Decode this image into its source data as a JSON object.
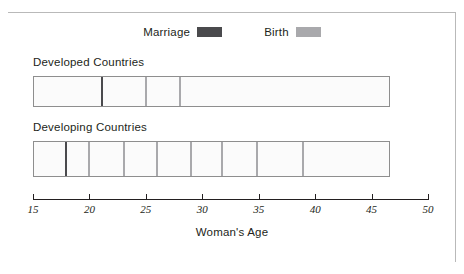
{
  "legend": {
    "items": [
      {
        "label": "Marriage",
        "color": "#4a4a4d",
        "name": "marriage"
      },
      {
        "label": "Birth",
        "color": "#a9a9ac",
        "name": "birth"
      }
    ]
  },
  "panels": [
    {
      "title": "Developed Countries"
    },
    {
      "title": "Developing Countries"
    }
  ],
  "axis": {
    "title": "Woman's Age",
    "ticks": [
      "15",
      "20",
      "25",
      "30",
      "35",
      "40",
      "45",
      "50"
    ]
  },
  "chart_data": {
    "type": "bar",
    "title": "",
    "subtitle": "",
    "xlabel": "Woman's Age",
    "ylabel": "",
    "xlim": [
      15,
      50
    ],
    "xticks": [
      15,
      20,
      25,
      30,
      35,
      40,
      45,
      50
    ],
    "grid": false,
    "legend_position": "top-center",
    "legend": [
      "Marriage",
      "Birth"
    ],
    "colors": {
      "marriage": "#4a4a4d",
      "birth": "#a9a9ac",
      "bar_fill": "#fbfbfb",
      "bar_border": "#8e8e8e"
    },
    "series": [
      {
        "name": "Developed Countries",
        "bar_start": 15,
        "bar_end": 46.6,
        "events": [
          {
            "type": "Marriage",
            "age": 21.0
          },
          {
            "type": "Birth",
            "age": 24.9
          },
          {
            "type": "Birth",
            "age": 27.9
          }
        ]
      },
      {
        "name": "Developing Countries",
        "bar_start": 15,
        "bar_end": 46.6,
        "events": [
          {
            "type": "Marriage",
            "age": 17.8
          },
          {
            "type": "Birth",
            "age": 19.9
          },
          {
            "type": "Birth",
            "age": 23.0
          },
          {
            "type": "Birth",
            "age": 25.9
          },
          {
            "type": "Birth",
            "age": 28.9
          },
          {
            "type": "Birth",
            "age": 31.7
          },
          {
            "type": "Birth",
            "age": 34.8
          },
          {
            "type": "Birth",
            "age": 38.8
          }
        ]
      }
    ]
  }
}
